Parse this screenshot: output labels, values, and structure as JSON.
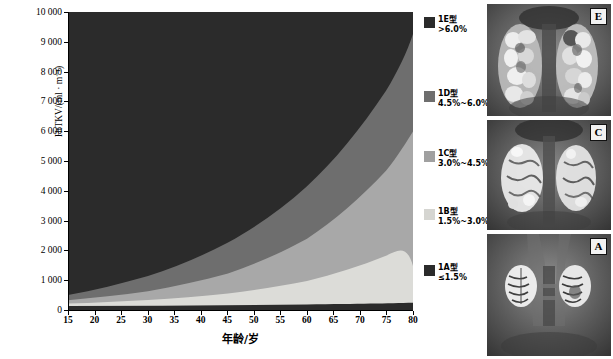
{
  "chart_data": {
    "type": "area",
    "title": "",
    "xlabel": "年龄/岁",
    "ylabel": "HtTKV/(ml · m⁻¹)",
    "xlim": [
      15,
      80
    ],
    "ylim": [
      0,
      10000
    ],
    "xticks": [
      15,
      20,
      25,
      30,
      35,
      40,
      45,
      50,
      55,
      60,
      65,
      70,
      75,
      80
    ],
    "yticks": [
      "0",
      "1 000",
      "2 000",
      "3 000",
      "4 000",
      "5 000",
      "6 000",
      "7 000",
      "8 000",
      "9 000",
      "10 000"
    ],
    "grid": false,
    "legend_position": "right",
    "series": [
      {
        "name": "1A型",
        "growth_rate": "≤1.5%",
        "color": "#2b2b2b",
        "x": [
          15,
          20,
          25,
          30,
          35,
          40,
          45,
          50,
          55,
          60,
          65,
          70,
          75,
          80
        ],
        "upper_boundary": [
          130,
          140,
          151,
          163,
          175,
          189,
          203,
          219,
          236,
          254,
          274,
          295,
          318,
          342
        ]
      },
      {
        "name": "1B型",
        "growth_rate": "1.5%~3.0%",
        "color": "#dcdcd8",
        "x": [
          15,
          20,
          25,
          30,
          35,
          40,
          45,
          50,
          55,
          60,
          65,
          70,
          75,
          80
        ],
        "upper_boundary": [
          215,
          250,
          290,
          336,
          390,
          452,
          524,
          608,
          705,
          817,
          948,
          1099,
          1274,
          1478
        ]
      },
      {
        "name": "1C型",
        "growth_rate": "3.0%~4.5%",
        "color": "#a8a8a8",
        "x": [
          15,
          20,
          25,
          30,
          35,
          40,
          45,
          50,
          55,
          60,
          65,
          70,
          75,
          80
        ],
        "upper_boundary": [
          330,
          412,
          514,
          641,
          800,
          998,
          1245,
          1553,
          1937,
          2417,
          3015,
          3761,
          4692,
          5853
        ]
      },
      {
        "name": "1D型",
        "growth_rate": "4.5%~6.0%",
        "color": "#6e6e6e",
        "x": [
          15,
          20,
          25,
          30,
          35,
          40,
          45,
          50,
          55,
          60,
          65,
          70,
          75,
          80
        ],
        "upper_boundary": [
          500,
          669,
          895,
          1198,
          1603,
          2145,
          2871,
          3841,
          5140,
          6878,
          9204,
          12316,
          16480,
          22050
        ]
      },
      {
        "name": "1E型",
        "growth_rate": ">6.0%",
        "color": "#2e2e2e",
        "x": [
          15,
          20,
          25,
          30,
          35,
          40,
          45,
          50,
          55,
          60,
          65,
          70,
          75,
          80
        ],
        "upper_boundary": [
          10000,
          10000,
          10000,
          10000,
          10000,
          10000,
          10000,
          10000,
          10000,
          10000,
          10000,
          10000,
          10000,
          10000
        ]
      }
    ]
  },
  "axes": {
    "y_title": "HtTKV/(ml · m⁻¹)",
    "x_title": "年龄/岁",
    "y_labels": [
      "10 000",
      "9 000",
      "8 000",
      "7 000",
      "6 000",
      "5 000",
      "4 000",
      "3 000",
      "2 000",
      "1 000",
      "0"
    ],
    "x_labels": [
      "15",
      "20",
      "25",
      "30",
      "35",
      "40",
      "45",
      "50",
      "55",
      "60",
      "65",
      "70",
      "75",
      "80"
    ]
  },
  "legend": {
    "items": [
      {
        "class_label": "1E型",
        "range_label": ">6.0%",
        "color": "#2b2b2b"
      },
      {
        "class_label": "1D型",
        "range_label": "4.5%~6.0%",
        "color": "#6e6e6e"
      },
      {
        "class_label": "1C型",
        "range_label": "3.0%~4.5%",
        "color": "#a0a0a0"
      },
      {
        "class_label": "1B型",
        "range_label": "1.5%~3.0%",
        "color": "#d5d5d1"
      },
      {
        "class_label": "1A型",
        "range_label": "≤1.5%",
        "color": "#2b2b2b"
      }
    ]
  },
  "mri_panels": [
    {
      "tag": "E",
      "alt": "coronal-mri-bilateral-massively-enlarged-polycystic-kidneys"
    },
    {
      "tag": "C",
      "alt": "coronal-mri-bilateral-moderately-enlarged-polycystic-kidneys"
    },
    {
      "tag": "A",
      "alt": "coronal-mri-bilateral-minimally-enlarged-kidneys"
    }
  ]
}
